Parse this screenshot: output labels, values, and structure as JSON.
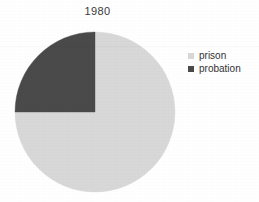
{
  "chart_data": {
    "type": "pie",
    "title": "1980",
    "categories": [
      "prison",
      "probation"
    ],
    "values": [
      75,
      25
    ],
    "value_unit": "percent",
    "colors": [
      "#d8d8d8",
      "#4a4a4a"
    ],
    "legend_position": "right",
    "grid": false,
    "xlabel": "",
    "ylabel": "",
    "start_angle_deg": 0,
    "direction": "clockwise",
    "slices": [
      {
        "label": "prison",
        "value": 75,
        "color": "#d8d8d8",
        "start_deg": 0,
        "end_deg": 270
      },
      {
        "label": "probation",
        "value": 25,
        "color": "#4a4a4a",
        "start_deg": 270,
        "end_deg": 360
      }
    ]
  },
  "legend": {
    "items": [
      {
        "label": "prison",
        "swatch_color": "#d8d8d8"
      },
      {
        "label": "probation",
        "swatch_color": "#4a4a4a"
      }
    ]
  },
  "geometry": {
    "center_x": 95,
    "center_y": 112,
    "radius": 80
  },
  "colors": {
    "background": "#ffffff",
    "prison": "#d8d8d8",
    "probation": "#4a4a4a",
    "text": "#333333"
  }
}
